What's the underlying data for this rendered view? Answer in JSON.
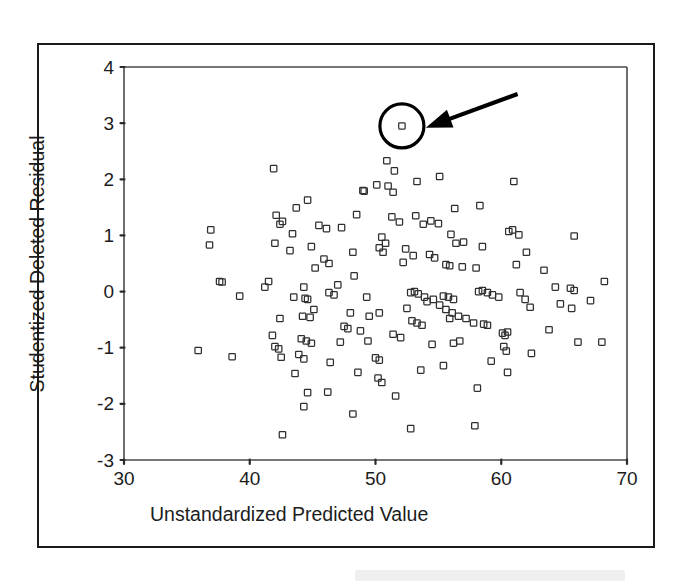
{
  "figure": {
    "background_color": "#ffffff",
    "frame_color": "#1a1a1a",
    "marker_color": "#2f2f2f",
    "annotation_color": "#000000"
  },
  "chart_data": {
    "type": "scatter",
    "title": "",
    "xlabel": "Unstandardized Predicted Value",
    "ylabel": "Studentized Deleted Residual",
    "xlim": [
      30,
      70
    ],
    "ylim": [
      -3,
      4
    ],
    "xticks": [
      30,
      40,
      50,
      60,
      70
    ],
    "yticks": [
      4,
      3,
      2,
      1,
      0,
      -1,
      -2,
      -3
    ],
    "xtick_labels": [
      "30",
      "40",
      "50",
      "60",
      "70"
    ],
    "ytick_labels": [
      "4",
      "3",
      "2",
      "1",
      "0",
      "-1",
      "-2",
      "-3"
    ],
    "grid": false,
    "legend": null,
    "marker_style": "open-square",
    "annotations": [
      {
        "type": "circle-highlight",
        "label": "outlier-highlight-circle",
        "x": 52.1,
        "y": 2.95,
        "radius_px": 22
      },
      {
        "type": "arrow",
        "label": "outlier-pointer-arrow",
        "from_x": 61.3,
        "from_y": 3.52,
        "to_x": 54.0,
        "to_y": 2.92
      }
    ],
    "points": [
      [
        52.1,
        2.95
      ],
      [
        41.9,
        2.19
      ],
      [
        50.9,
        2.33
      ],
      [
        51.5,
        2.15
      ],
      [
        53.3,
        1.96
      ],
      [
        55.1,
        2.05
      ],
      [
        61.0,
        1.96
      ],
      [
        49.0,
        1.8
      ],
      [
        49.1,
        1.79
      ],
      [
        50.1,
        1.9
      ],
      [
        51.0,
        1.88
      ],
      [
        51.4,
        1.77
      ],
      [
        44.6,
        1.63
      ],
      [
        43.7,
        1.49
      ],
      [
        56.3,
        1.48
      ],
      [
        58.3,
        1.53
      ],
      [
        42.1,
        1.36
      ],
      [
        42.6,
        1.25
      ],
      [
        42.4,
        1.2
      ],
      [
        48.5,
        1.37
      ],
      [
        51.3,
        1.33
      ],
      [
        51.9,
        1.24
      ],
      [
        53.2,
        1.35
      ],
      [
        53.8,
        1.2
      ],
      [
        54.4,
        1.26
      ],
      [
        55.0,
        1.21
      ],
      [
        45.5,
        1.18
      ],
      [
        46.1,
        1.12
      ],
      [
        47.3,
        1.14
      ],
      [
        43.4,
        1.03
      ],
      [
        36.9,
        1.1
      ],
      [
        36.8,
        0.83
      ],
      [
        42.0,
        0.86
      ],
      [
        50.5,
        0.97
      ],
      [
        50.8,
        0.86
      ],
      [
        56.0,
        1.02
      ],
      [
        56.4,
        0.86
      ],
      [
        57.0,
        0.88
      ],
      [
        60.6,
        1.07
      ],
      [
        60.9,
        1.1
      ],
      [
        61.4,
        1.01
      ],
      [
        65.8,
        0.99
      ],
      [
        43.2,
        0.73
      ],
      [
        44.9,
        0.8
      ],
      [
        48.2,
        0.7
      ],
      [
        50.3,
        0.78
      ],
      [
        50.6,
        0.7
      ],
      [
        52.4,
        0.76
      ],
      [
        53.0,
        0.64
      ],
      [
        54.3,
        0.66
      ],
      [
        54.7,
        0.6
      ],
      [
        58.5,
        0.8
      ],
      [
        62.0,
        0.7
      ],
      [
        45.9,
        0.58
      ],
      [
        46.3,
        0.5
      ],
      [
        45.2,
        0.42
      ],
      [
        52.2,
        0.52
      ],
      [
        55.6,
        0.48
      ],
      [
        55.9,
        0.46
      ],
      [
        56.9,
        0.44
      ],
      [
        58.0,
        0.42
      ],
      [
        61.2,
        0.48
      ],
      [
        63.4,
        0.38
      ],
      [
        41.5,
        0.18
      ],
      [
        41.2,
        0.08
      ],
      [
        44.3,
        0.08
      ],
      [
        47.0,
        0.12
      ],
      [
        48.3,
        0.28
      ],
      [
        37.6,
        0.18
      ],
      [
        37.8,
        0.17
      ],
      [
        39.2,
        -0.08
      ],
      [
        43.5,
        -0.1
      ],
      [
        44.4,
        -0.12
      ],
      [
        44.6,
        -0.14
      ],
      [
        46.3,
        -0.02
      ],
      [
        46.7,
        -0.06
      ],
      [
        49.3,
        -0.1
      ],
      [
        52.8,
        -0.02
      ],
      [
        53.1,
        0.0
      ],
      [
        53.4,
        -0.04
      ],
      [
        53.9,
        -0.1
      ],
      [
        54.6,
        -0.14
      ],
      [
        55.4,
        -0.08
      ],
      [
        55.8,
        -0.1
      ],
      [
        56.2,
        -0.14
      ],
      [
        58.2,
        0.0
      ],
      [
        58.5,
        0.02
      ],
      [
        58.9,
        -0.02
      ],
      [
        59.3,
        -0.06
      ],
      [
        59.8,
        -0.1
      ],
      [
        61.5,
        -0.02
      ],
      [
        61.9,
        -0.14
      ],
      [
        64.3,
        0.08
      ],
      [
        65.5,
        0.06
      ],
      [
        65.8,
        0.02
      ],
      [
        67.1,
        -0.16
      ],
      [
        68.2,
        0.18
      ],
      [
        42.4,
        -0.48
      ],
      [
        44.2,
        -0.44
      ],
      [
        44.8,
        -0.46
      ],
      [
        45.1,
        -0.32
      ],
      [
        48.0,
        -0.38
      ],
      [
        49.5,
        -0.44
      ],
      [
        50.3,
        -0.38
      ],
      [
        52.5,
        -0.3
      ],
      [
        54.1,
        -0.18
      ],
      [
        55.1,
        -0.24
      ],
      [
        55.6,
        -0.32
      ],
      [
        56.1,
        -0.38
      ],
      [
        56.6,
        -0.44
      ],
      [
        57.2,
        -0.48
      ],
      [
        57.8,
        -0.56
      ],
      [
        62.3,
        -0.28
      ],
      [
        63.8,
        -0.68
      ],
      [
        64.7,
        -0.22
      ],
      [
        65.6,
        -0.3
      ],
      [
        47.5,
        -0.62
      ],
      [
        47.8,
        -0.66
      ],
      [
        48.8,
        -0.7
      ],
      [
        52.9,
        -0.52
      ],
      [
        53.3,
        -0.56
      ],
      [
        53.7,
        -0.6
      ],
      [
        55.9,
        -0.48
      ],
      [
        58.6,
        -0.58
      ],
      [
        58.9,
        -0.6
      ],
      [
        60.1,
        -0.74
      ],
      [
        60.3,
        -0.78
      ],
      [
        60.5,
        -0.72
      ],
      [
        41.8,
        -0.78
      ],
      [
        44.1,
        -0.84
      ],
      [
        44.5,
        -0.88
      ],
      [
        44.9,
        -0.92
      ],
      [
        47.2,
        -0.9
      ],
      [
        49.4,
        -0.88
      ],
      [
        51.4,
        -0.76
      ],
      [
        52.0,
        -0.82
      ],
      [
        54.5,
        -0.94
      ],
      [
        56.2,
        -0.92
      ],
      [
        56.7,
        -0.88
      ],
      [
        66.1,
        -0.9
      ],
      [
        68.0,
        -0.9
      ],
      [
        35.9,
        -1.05
      ],
      [
        42.0,
        -0.98
      ],
      [
        42.3,
        -1.02
      ],
      [
        60.2,
        -0.98
      ],
      [
        60.4,
        -1.06
      ],
      [
        38.6,
        -1.16
      ],
      [
        42.5,
        -1.17
      ],
      [
        43.9,
        -1.12
      ],
      [
        44.3,
        -1.2
      ],
      [
        50.0,
        -1.18
      ],
      [
        50.3,
        -1.22
      ],
      [
        62.4,
        -1.1
      ],
      [
        59.2,
        -1.24
      ],
      [
        43.6,
        -1.46
      ],
      [
        46.4,
        -1.26
      ],
      [
        48.6,
        -1.44
      ],
      [
        50.2,
        -1.54
      ],
      [
        50.5,
        -1.62
      ],
      [
        53.6,
        -1.4
      ],
      [
        55.4,
        -1.32
      ],
      [
        58.1,
        -1.72
      ],
      [
        60.5,
        -1.44
      ],
      [
        44.6,
        -1.8
      ],
      [
        46.2,
        -1.79
      ],
      [
        51.6,
        -1.86
      ],
      [
        44.3,
        -2.05
      ],
      [
        48.2,
        -2.18
      ],
      [
        52.8,
        -2.44
      ],
      [
        57.9,
        -2.39
      ],
      [
        42.6,
        -2.55
      ]
    ]
  }
}
